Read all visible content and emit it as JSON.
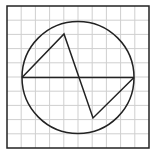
{
  "diagram": {
    "grid": {
      "x0": 7,
      "y0": 6,
      "size": 142,
      "cells": 10,
      "color": "#cfcfcf"
    },
    "border": {
      "color": "#222222"
    },
    "circle": {
      "cx": 78,
      "cy": 77.5,
      "r": 56,
      "color": "#222222"
    },
    "diameter": {
      "x1": 22,
      "y1": 77.5,
      "x2": 134,
      "y2": 77.5
    },
    "polyline": [
      [
        22,
        77.5
      ],
      [
        64,
        34
      ],
      [
        93,
        118
      ],
      [
        134,
        77.5
      ]
    ],
    "stroke_color": "#222222"
  }
}
